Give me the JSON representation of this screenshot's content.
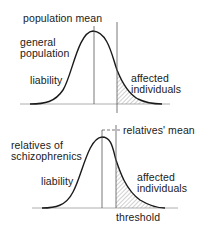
{
  "top_panel": {
    "mean_label": "population mean",
    "group_label_line1": "general",
    "group_label_line2": "population",
    "axis_label": "liability",
    "affected_line1": "affected",
    "affected_line2": "individuals"
  },
  "bottom_panel": {
    "mean_label": "relatives' mean",
    "group_label_line1": "relatives of",
    "group_label_line2": "schizophrenics",
    "axis_label": "liability",
    "affected_line1": "affected",
    "affected_line2": "individuals",
    "threshold_label": "threshold"
  },
  "colors": {
    "ink": "#1a1a1a",
    "hatch": "#8a8a8a",
    "background": "#ffffff"
  }
}
